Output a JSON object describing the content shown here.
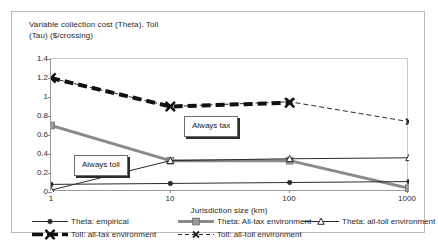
{
  "chart_data": {
    "type": "line",
    "title": "Variable collection cost (Theta),  Toll\n(Tau) ($/crossing)",
    "xlabel": "Jurisdiction size (km)",
    "ylabel": "",
    "x": [
      1,
      10,
      100,
      1000
    ],
    "x_tick_labels": [
      "1",
      "10",
      "100",
      "1000"
    ],
    "x_scale": "log",
    "y_tick_labels": [
      "0",
      "0.2",
      "0.4",
      "0.6",
      "0.8",
      "1",
      "1.2",
      "1.4"
    ],
    "y_ticks": [
      0,
      0.2,
      0.4,
      0.6,
      0.8,
      1,
      1.2,
      1.4
    ],
    "ylim": [
      0,
      1.4
    ],
    "grid": false,
    "legend_position": "bottom",
    "series": [
      {
        "name": "Theta: empirical",
        "values": [
          0.08,
          0.09,
          0.1,
          0.11
        ],
        "color": "#2b2b2b",
        "marker": "circle",
        "dash": "solid",
        "width": 1
      },
      {
        "name": "Theta: All-tax environment",
        "values": [
          0.7,
          0.33,
          0.33,
          0.04
        ],
        "color": "#8a8a8a",
        "marker": "square",
        "dash": "solid",
        "width": 3
      },
      {
        "name": "Theta: all-toll environment",
        "values": [
          0.02,
          0.33,
          0.35,
          0.36
        ],
        "color": "#2b2b2b",
        "marker": "triangle",
        "dash": "solid",
        "width": 1
      },
      {
        "name": "Toll: all-tax environment",
        "values": [
          1.2,
          0.9,
          0.94,
          null
        ],
        "color": "#111111",
        "marker": "cross",
        "dash": "dashed-heavy",
        "width": 4
      },
      {
        "name": "Toll: all-toll environment",
        "values": [
          1.2,
          0.9,
          0.95,
          0.74
        ],
        "color": "#2b2b2b",
        "marker": "cross-small",
        "dash": "dashed-light",
        "width": 1
      }
    ],
    "annotations": [
      {
        "text": "Always tax"
      },
      {
        "text": "Always toll"
      }
    ]
  }
}
